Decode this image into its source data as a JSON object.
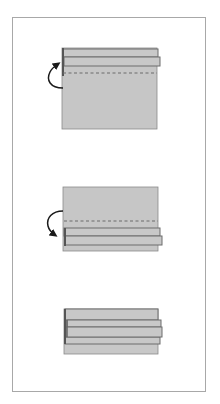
{
  "colors": {
    "paper_fill": "#c6c6c6",
    "paper_fill_light": "#cbcbcb",
    "edge": "#6c6c6c",
    "fold_edge_dark": "#555555",
    "dashed_line": "#6a6a6a",
    "arrow": "#1a1a1a",
    "frame": "#a8a8a8"
  },
  "steps": [
    {
      "id": 1,
      "description": "Paper rectangle with two folded strips at the top; fold along dashed line, arrow indicates folding upward/back",
      "arrow_direction": "up",
      "fold_line": "dashed"
    },
    {
      "id": 2,
      "description": "Paper rectangle with two folded strips at the bottom; fold along dashed line, arrow indicates folding downward",
      "arrow_direction": "down",
      "fold_line": "dashed"
    },
    {
      "id": 3,
      "description": "Final result: layered folded strips",
      "arrow_direction": "none",
      "fold_line": "none"
    }
  ]
}
